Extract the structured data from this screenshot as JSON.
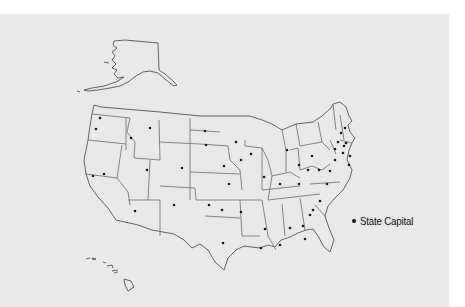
{
  "map": {
    "title": "",
    "region": "United States",
    "background_color": "#e9e9e9",
    "border_color": "#6a6a6a",
    "marker_color": "#111111",
    "capital_markers": [
      {
        "x": 100,
        "y": 118
      },
      {
        "x": 96,
        "y": 129
      },
      {
        "x": 131,
        "y": 138
      },
      {
        "x": 150,
        "y": 128
      },
      {
        "x": 93,
        "y": 176
      },
      {
        "x": 104,
        "y": 174
      },
      {
        "x": 147,
        "y": 170
      },
      {
        "x": 182,
        "y": 168
      },
      {
        "x": 174,
        "y": 205
      },
      {
        "x": 135,
        "y": 211
      },
      {
        "x": 209,
        "y": 205
      },
      {
        "x": 205,
        "y": 131
      },
      {
        "x": 206,
        "y": 145
      },
      {
        "x": 224,
        "y": 166
      },
      {
        "x": 229,
        "y": 184
      },
      {
        "x": 222,
        "y": 210
      },
      {
        "x": 223,
        "y": 243
      },
      {
        "x": 241,
        "y": 212
      },
      {
        "x": 241,
        "y": 160
      },
      {
        "x": 236,
        "y": 142
      },
      {
        "x": 251,
        "y": 154
      },
      {
        "x": 264,
        "y": 177
      },
      {
        "x": 261,
        "y": 248
      },
      {
        "x": 265,
        "y": 229
      },
      {
        "x": 280,
        "y": 184
      },
      {
        "x": 287,
        "y": 150
      },
      {
        "x": 299,
        "y": 165
      },
      {
        "x": 280,
        "y": 245
      },
      {
        "x": 290,
        "y": 228
      },
      {
        "x": 299,
        "y": 184
      },
      {
        "x": 308,
        "y": 170
      },
      {
        "x": 319,
        "y": 170
      },
      {
        "x": 320,
        "y": 201
      },
      {
        "x": 310,
        "y": 215
      },
      {
        "x": 303,
        "y": 226
      },
      {
        "x": 305,
        "y": 239
      },
      {
        "x": 312,
        "y": 156
      },
      {
        "x": 313,
        "y": 210
      },
      {
        "x": 330,
        "y": 171
      },
      {
        "x": 327,
        "y": 184
      },
      {
        "x": 335,
        "y": 160
      },
      {
        "x": 335,
        "y": 149
      },
      {
        "x": 338,
        "y": 142
      },
      {
        "x": 341,
        "y": 133
      },
      {
        "x": 345,
        "y": 128
      },
      {
        "x": 344,
        "y": 146
      },
      {
        "x": 343,
        "y": 153
      },
      {
        "x": 346,
        "y": 143
      },
      {
        "x": 350,
        "y": 156
      },
      {
        "x": 349,
        "y": 165
      }
    ]
  },
  "legend": {
    "items": [
      {
        "symbol": "dot",
        "label": "State Capital"
      }
    ]
  }
}
